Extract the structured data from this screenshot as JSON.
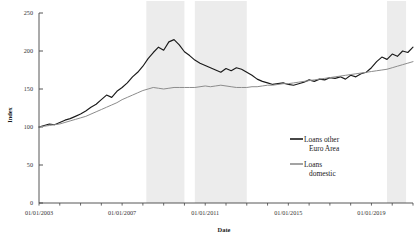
{
  "chart_data": {
    "type": "line",
    "title": "",
    "xlabel": "Date",
    "ylabel": "Index",
    "ylim": [
      0,
      250
    ],
    "yticks": [
      0,
      50,
      100,
      150,
      200,
      250
    ],
    "xlim": [
      "01/01/2003",
      "01/01/2021"
    ],
    "xticks": [
      "01/01/2003",
      "01/01/2007",
      "01/01/2011",
      "01/01/2015",
      "01/01/2019"
    ],
    "grid": false,
    "legend_position": "center-right",
    "colors": {
      "loans_other_euro_area": "#1a1a1a",
      "loans_domestic": "#8c8c8c",
      "shaded_band": "#ececec"
    },
    "shaded_bands": [
      {
        "start": "2008-03",
        "end": "2010-01"
      },
      {
        "start": "2010-07",
        "end": "2013-01"
      },
      {
        "start": "2019-10",
        "end": "2020-09"
      }
    ],
    "series": [
      {
        "name": "Loans other Euro Area",
        "color": "#1a1a1a",
        "x": [
          "2003.0",
          "2003.25",
          "2003.5",
          "2003.75",
          "2004.0",
          "2004.25",
          "2004.5",
          "2004.75",
          "2005.0",
          "2005.25",
          "2005.5",
          "2005.75",
          "2006.0",
          "2006.25",
          "2006.5",
          "2006.75",
          "2007.0",
          "2007.25",
          "2007.5",
          "2007.75",
          "2008.0",
          "2008.25",
          "2008.5",
          "2008.75",
          "2009.0",
          "2009.25",
          "2009.5",
          "2009.75",
          "2010.0",
          "2010.25",
          "2010.5",
          "2010.75",
          "2011.0",
          "2011.25",
          "2011.5",
          "2011.75",
          "2012.0",
          "2012.25",
          "2012.5",
          "2012.75",
          "2013.0",
          "2013.25",
          "2013.5",
          "2013.75",
          "2014.0",
          "2014.25",
          "2014.5",
          "2014.75",
          "2015.0",
          "2015.25",
          "2015.5",
          "2015.75",
          "2016.0",
          "2016.25",
          "2016.5",
          "2016.75",
          "2017.0",
          "2017.25",
          "2017.5",
          "2017.75",
          "2018.0",
          "2018.25",
          "2018.5",
          "2018.75",
          "2019.0",
          "2019.25",
          "2019.5",
          "2019.75",
          "2020.0",
          "2020.25",
          "2020.5",
          "2020.75",
          "2021.0"
        ],
        "values": [
          100,
          102,
          104,
          103,
          106,
          109,
          111,
          114,
          117,
          121,
          126,
          130,
          136,
          142,
          139,
          147,
          152,
          158,
          166,
          172,
          180,
          190,
          198,
          205,
          201,
          212,
          215,
          208,
          199,
          194,
          188,
          184,
          181,
          178,
          175,
          172,
          177,
          174,
          178,
          176,
          172,
          168,
          163,
          160,
          158,
          156,
          157,
          158,
          156,
          155,
          157,
          159,
          162,
          160,
          163,
          162,
          165,
          164,
          166,
          163,
          168,
          166,
          170,
          172,
          178,
          186,
          192,
          189,
          196,
          193,
          200,
          198,
          205
        ]
      },
      {
        "name": "Loans domestic",
        "color": "#8c8c8c",
        "x": [
          "2003.0",
          "2003.25",
          "2003.5",
          "2003.75",
          "2004.0",
          "2004.25",
          "2004.5",
          "2004.75",
          "2005.0",
          "2005.25",
          "2005.5",
          "2005.75",
          "2006.0",
          "2006.25",
          "2006.5",
          "2006.75",
          "2007.0",
          "2007.25",
          "2007.5",
          "2007.75",
          "2008.0",
          "2008.25",
          "2008.5",
          "2008.75",
          "2009.0",
          "2009.25",
          "2009.5",
          "2009.75",
          "2010.0",
          "2010.25",
          "2010.5",
          "2010.75",
          "2011.0",
          "2011.25",
          "2011.5",
          "2011.75",
          "2012.0",
          "2012.25",
          "2012.5",
          "2012.75",
          "2013.0",
          "2013.25",
          "2013.5",
          "2013.75",
          "2014.0",
          "2014.25",
          "2014.5",
          "2014.75",
          "2015.0",
          "2015.25",
          "2015.5",
          "2015.75",
          "2016.0",
          "2016.25",
          "2016.5",
          "2016.75",
          "2017.0",
          "2017.25",
          "2017.5",
          "2017.75",
          "2018.0",
          "2018.25",
          "2018.5",
          "2018.75",
          "2019.0",
          "2019.25",
          "2019.5",
          "2019.75",
          "2020.0",
          "2020.25",
          "2020.5",
          "2020.75",
          "2021.0"
        ],
        "values": [
          100,
          101,
          102,
          103,
          104,
          106,
          108,
          110,
          112,
          114,
          117,
          120,
          123,
          126,
          129,
          132,
          136,
          139,
          142,
          145,
          148,
          150,
          152,
          151,
          150,
          151,
          152,
          152,
          152,
          152,
          152,
          153,
          154,
          153,
          154,
          155,
          154,
          153,
          152,
          152,
          152,
          153,
          153,
          154,
          155,
          155,
          156,
          157,
          157,
          158,
          159,
          160,
          161,
          162,
          163,
          164,
          165,
          166,
          167,
          168,
          169,
          170,
          171,
          172,
          173,
          174,
          175,
          176,
          178,
          180,
          182,
          184,
          186
        ]
      }
    ]
  },
  "legend": {
    "entries": [
      {
        "label_line1": "Loans other",
        "label_line2": "Euro Area"
      },
      {
        "label_line1": "Loans",
        "label_line2": "domestic"
      }
    ]
  },
  "axes": {
    "y_title": "Index",
    "x_title": "Date",
    "y_tick_labels": [
      "250",
      "200",
      "150",
      "100",
      "50",
      "0"
    ],
    "x_tick_labels": [
      "01/01/2003",
      "01/01/2007",
      "01/01/2011",
      "01/01/2015",
      "01/01/2019"
    ]
  }
}
